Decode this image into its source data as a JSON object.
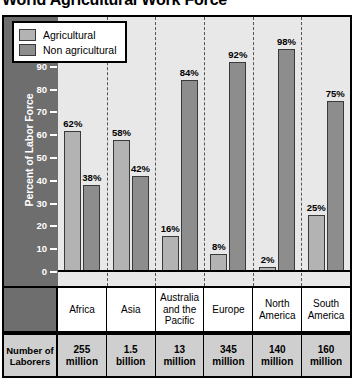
{
  "chart_data": {
    "type": "bar",
    "title": "World Agricultural Work Force",
    "xlabel": "",
    "ylabel": "Percent of Labor Force",
    "ylim": [
      0,
      100
    ],
    "ytick_step": 10,
    "yticks": [
      100,
      90,
      80,
      70,
      60,
      50,
      40,
      30,
      20,
      10,
      0
    ],
    "ytick_labels": [
      "100",
      "90",
      "80",
      "70",
      "60",
      "50",
      "40",
      "30",
      "20",
      "10",
      "0"
    ],
    "grid": false,
    "legend_position": "top-left",
    "value_suffix": "%",
    "categories": [
      "Africa",
      "Asia",
      "Australia and the Pacific",
      "Europe",
      "North America",
      "South America"
    ],
    "series": [
      {
        "name": "Agricultural",
        "color": "#b3b3b3",
        "values": [
          62,
          58,
          16,
          8,
          2,
          25
        ],
        "labels": [
          "62%",
          "58%",
          "16%",
          "8%",
          "2%",
          "25%"
        ]
      },
      {
        "name": "Non agricultural",
        "color": "#8d8d8d",
        "values": [
          38,
          42,
          84,
          92,
          98,
          75
        ],
        "labels": [
          "38%",
          "42%",
          "84%",
          "92%",
          "98%",
          "75%"
        ]
      }
    ],
    "annotations": {
      "laborers_row_label": "Number of Laborers",
      "laborers": [
        "255 million",
        "1.5 billion",
        "13 million",
        "345 million",
        "140 million",
        "160 million"
      ]
    }
  },
  "legend": {
    "items": [
      {
        "label": "Agricultural",
        "color": "#b3b3b3"
      },
      {
        "label": "Non agricultural",
        "color": "#8d8d8d"
      }
    ]
  },
  "table": {
    "row_header": "Number of Laborers",
    "row_header_line1": "Number of",
    "row_header_line2": "Laborers",
    "categories": [
      {
        "line1": "Africa",
        "line2": "",
        "line3": ""
      },
      {
        "line1": "Asia",
        "line2": "",
        "line3": ""
      },
      {
        "line1": "Australia",
        "line2": "and the",
        "line3": "Pacific"
      },
      {
        "line1": "Europe",
        "line2": "",
        "line3": ""
      },
      {
        "line1": "North",
        "line2": "America",
        "line3": ""
      },
      {
        "line1": "South",
        "line2": "America",
        "line3": ""
      }
    ],
    "laborers": [
      {
        "amount": "255",
        "unit": "million"
      },
      {
        "amount": "1.5",
        "unit": "billion"
      },
      {
        "amount": "13",
        "unit": "million"
      },
      {
        "amount": "345",
        "unit": "million"
      },
      {
        "amount": "140",
        "unit": "million"
      },
      {
        "amount": "160",
        "unit": "million"
      }
    ]
  },
  "colors": {
    "agricultural": "#b3b3b3",
    "non_agricultural": "#8d8d8d",
    "axis_band": "#6e6e6e",
    "plot_background": "#e8e8e8",
    "table_background": "#cfcfcf",
    "outline": "#000000"
  }
}
